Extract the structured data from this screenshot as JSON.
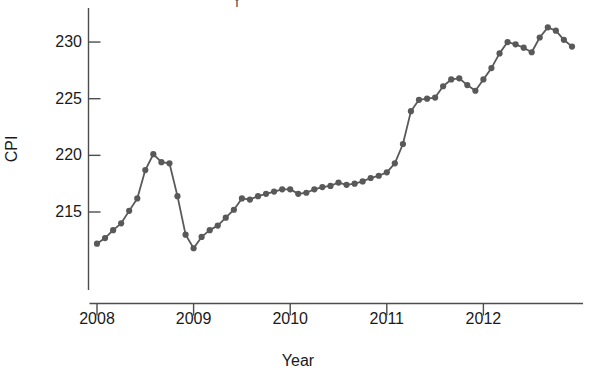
{
  "figure": {
    "cropped_title_fragment": "I",
    "axis_color": "#4d4d4d",
    "series_color": "#595959",
    "background": "#ffffff"
  },
  "chart_data": {
    "type": "line",
    "title": "",
    "xlabel": "Year",
    "ylabel": "CPI",
    "xlim": [
      2008.0,
      2012.96
    ],
    "ylim": [
      211.5,
      231.8
    ],
    "grid": false,
    "legend": null,
    "markers": true,
    "yticks": [
      215,
      220,
      225,
      230
    ],
    "ytick_labels": [
      "215",
      "220",
      "225",
      "230"
    ],
    "xticks": [
      2008,
      2009,
      2010,
      2011,
      2012
    ],
    "xtick_labels": [
      "2008",
      "2009",
      "2010",
      "2011",
      "2012"
    ],
    "series": [
      {
        "name": "CPI",
        "x": [
          2008.0,
          2008.083,
          2008.167,
          2008.25,
          2008.333,
          2008.417,
          2008.5,
          2008.583,
          2008.667,
          2008.75,
          2008.833,
          2008.917,
          2009.0,
          2009.083,
          2009.167,
          2009.25,
          2009.333,
          2009.417,
          2009.5,
          2009.583,
          2009.667,
          2009.75,
          2009.833,
          2009.917,
          2010.0,
          2010.083,
          2010.167,
          2010.25,
          2010.333,
          2010.417,
          2010.5,
          2010.583,
          2010.667,
          2010.75,
          2010.833,
          2010.917,
          2011.0,
          2011.083,
          2011.167,
          2011.25,
          2011.333,
          2011.417,
          2011.5,
          2011.583,
          2011.667,
          2011.75,
          2011.833,
          2011.917,
          2012.0,
          2012.083,
          2012.167,
          2012.25,
          2012.333,
          2012.417,
          2012.5,
          2012.583,
          2012.667,
          2012.75,
          2012.833,
          2012.917
        ],
        "y": [
          212.2,
          212.7,
          213.4,
          214.0,
          215.1,
          216.2,
          218.7,
          220.1,
          219.4,
          219.3,
          216.4,
          213.0,
          211.8,
          212.8,
          213.4,
          213.8,
          214.5,
          215.2,
          216.2,
          216.1,
          216.4,
          216.6,
          216.8,
          217.0,
          217.0,
          216.6,
          216.7,
          217.0,
          217.2,
          217.3,
          217.6,
          217.4,
          217.5,
          217.7,
          218.0,
          218.2,
          218.5,
          219.3,
          221.0,
          223.9,
          224.9,
          225.0,
          225.1,
          226.1,
          226.7,
          226.8,
          226.2,
          225.7,
          226.7,
          227.7,
          229.0,
          230.0,
          229.8,
          229.5,
          229.1,
          230.4,
          231.3,
          231.0,
          230.2,
          229.6
        ]
      }
    ]
  },
  "axis": {
    "y_axis_name": "CPI",
    "x_axis_name": "Year"
  }
}
